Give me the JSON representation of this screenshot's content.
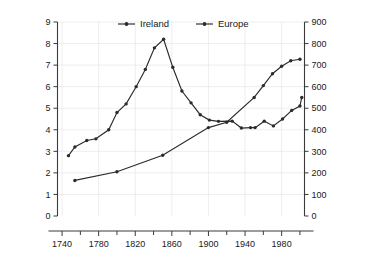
{
  "chart_data": {
    "type": "line",
    "title": "",
    "xlabel": "",
    "ylabel": "Population of Ireland (millions)",
    "ylabel_right": "Population of Europe (millions)",
    "xlim": [
      1735,
      2005
    ],
    "ylim": [
      0,
      9
    ],
    "ylim_right": [
      0,
      900
    ],
    "grid": true,
    "legend_position": "top-center",
    "x_ticks_major": [
      1740,
      1780,
      1820,
      1860,
      1900,
      1940,
      1980
    ],
    "x_ticks_major_labels": [
      "1740",
      "1780",
      "1820",
      "1860",
      "1900",
      "1940",
      "1980"
    ],
    "x_ticks_minor": [
      1760,
      1800,
      1840,
      1880,
      1920,
      1960,
      2000
    ],
    "y_ticks_left": [
      0,
      1,
      2,
      3,
      4,
      5,
      6,
      7,
      8,
      9
    ],
    "y_ticks_left_labels": [
      "0",
      "1",
      "2",
      "3",
      "4",
      "5",
      "6",
      "7",
      "8",
      "9"
    ],
    "y_ticks_right": [
      0,
      100,
      200,
      300,
      400,
      500,
      600,
      700,
      800,
      900
    ],
    "y_ticks_right_labels": [
      "0",
      "100",
      "200",
      "300",
      "400",
      "500",
      "600",
      "700",
      "800",
      "900"
    ],
    "series": [
      {
        "name": "Ireland",
        "axis": "left",
        "units": "millions",
        "x": [
          1747,
          1754,
          1767,
          1777,
          1791,
          1800,
          1810,
          1821,
          1831,
          1841,
          1851,
          1861,
          1871,
          1881,
          1891,
          1901,
          1911,
          1926,
          1936,
          1946,
          1951,
          1961,
          1971,
          1981,
          1991,
          2000
        ],
        "y": [
          2.8,
          3.2,
          3.5,
          3.58,
          4.0,
          4.8,
          5.2,
          6.0,
          6.8,
          7.8,
          8.2,
          6.9,
          5.8,
          5.25,
          4.7,
          4.45,
          4.39,
          4.4,
          4.08,
          4.1,
          4.1,
          4.4,
          4.18,
          4.5,
          4.9,
          5.1
        ],
        "y_end_extra": 5.5,
        "marker": "circle"
      },
      {
        "name": "Europe",
        "axis": "right",
        "units": "millions",
        "x": [
          1754,
          1800,
          1850,
          1900,
          1920,
          1950,
          1960,
          1970,
          1980,
          1990,
          2000
        ],
        "y": [
          165,
          205,
          282,
          410,
          435,
          550,
          605,
          660,
          695,
          720,
          727
        ],
        "marker": "circle"
      }
    ],
    "legend": [
      {
        "label": "Ireland",
        "marker": "circle",
        "color": "#2b2b2b"
      },
      {
        "label": "Europe",
        "marker": "circle",
        "color": "#2b2b2b"
      }
    ],
    "colors": {
      "line": "#2b2b2b",
      "axis": "#3a3a3a",
      "grid": "#e2e2e6",
      "background": "#ffffff",
      "text": "#1a1a1a"
    }
  }
}
